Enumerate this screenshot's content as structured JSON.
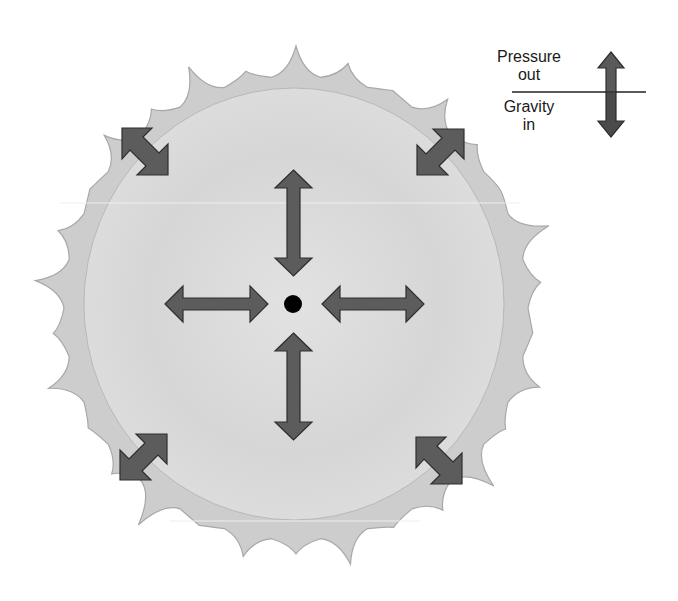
{
  "diagram": {
    "legend": {
      "outward_label_line1": "Pressure",
      "outward_label_line2": "out",
      "inward_label_line1": "Gravity",
      "inward_label_line2": "in"
    },
    "arrows": [
      {
        "position": "top",
        "type": "double-headed",
        "orientation": "vertical"
      },
      {
        "position": "bottom",
        "type": "double-headed",
        "orientation": "vertical"
      },
      {
        "position": "left",
        "type": "double-headed",
        "orientation": "horizontal"
      },
      {
        "position": "right",
        "type": "double-headed",
        "orientation": "horizontal"
      },
      {
        "position": "top-left",
        "type": "double-headed",
        "orientation": "diagonal"
      },
      {
        "position": "top-right",
        "type": "double-headed",
        "orientation": "diagonal"
      },
      {
        "position": "bottom-left",
        "type": "double-headed",
        "orientation": "diagonal"
      },
      {
        "position": "bottom-right",
        "type": "double-headed",
        "orientation": "diagonal"
      }
    ],
    "colors": {
      "corona": "#cdcdcd",
      "corona_stroke": "#a8a8a8",
      "core": "#dadada",
      "arrow_fill": "#5c5c5c",
      "arrow_stroke": "#2e2e2e",
      "center_dot": "#000000"
    }
  }
}
